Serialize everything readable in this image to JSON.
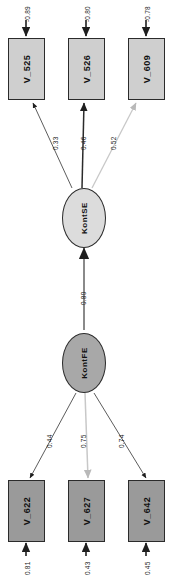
{
  "diagram": {
    "type": "sem-path-diagram",
    "orientation": "rotated-90",
    "colors": {
      "observed_fill_light": "#cfcfcf",
      "observed_fill_dark": "#9a9a9a",
      "latent_fill_light": "#dcdcdc",
      "latent_fill_dark": "#a8a8a8",
      "stroke": "#2b2b2b",
      "faint_stroke": "#c8c8c8"
    },
    "latent_variables": [
      {
        "id": "KontSE",
        "label": "KontSE"
      },
      {
        "id": "KontFE",
        "label": "KontFE"
      }
    ],
    "observed_variables": [
      {
        "id": "V_525",
        "label": "V_525"
      },
      {
        "id": "V_526",
        "label": "V_526"
      },
      {
        "id": "V_609",
        "label": "V_609"
      },
      {
        "id": "V_622",
        "label": "V_622"
      },
      {
        "id": "V_627",
        "label": "V_627"
      },
      {
        "id": "V_642",
        "label": "V_642"
      }
    ],
    "residuals": [
      {
        "target": "V_525",
        "value": "-0.89"
      },
      {
        "target": "V_526",
        "value": "-0.80"
      },
      {
        "target": "V_609",
        "value": "-0.78"
      },
      {
        "target": "V_622",
        "value": "0.81"
      },
      {
        "target": "V_627",
        "value": "0.43"
      },
      {
        "target": "V_642",
        "value": "0.45"
      }
    ],
    "loadings": [
      {
        "from": "KontSE",
        "to": "V_525",
        "value": "0.33"
      },
      {
        "from": "KontSE",
        "to": "V_526",
        "value": "0.46"
      },
      {
        "from": "KontSE",
        "to": "V_609",
        "value": "0.52"
      },
      {
        "from": "KontFE",
        "to": "V_622",
        "value": "0.44"
      },
      {
        "from": "KontFE",
        "to": "V_627",
        "value": "0.75"
      },
      {
        "from": "KontFE",
        "to": "V_642",
        "value": "0.74"
      }
    ],
    "structural_paths": [
      {
        "from": "KontFE",
        "to": "KontSE",
        "value": "0.80"
      }
    ]
  }
}
